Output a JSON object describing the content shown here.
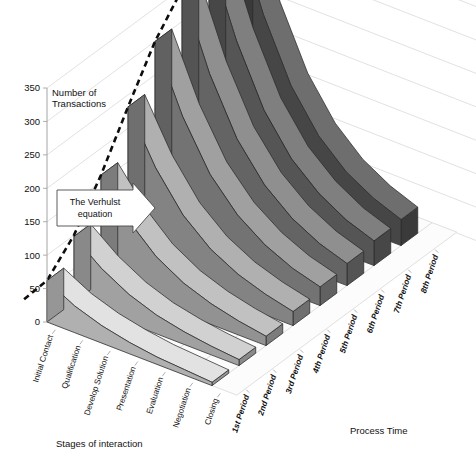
{
  "chart_data": {
    "type": "area",
    "title": "",
    "subtitle": "",
    "zlabel": "Number of Transactions",
    "xlabel": "Stages of interaction",
    "ylabel": "Process Time",
    "zlim": [
      0,
      350
    ],
    "zticks": [
      "0",
      "50",
      "100",
      "150",
      "200",
      "250",
      "300",
      "350"
    ],
    "ztick_values": [
      0,
      50,
      100,
      150,
      200,
      250,
      300,
      350
    ],
    "grid": true,
    "legend": "none",
    "categories": [
      "Initial Contact",
      "Qualification",
      "Develop Solution",
      "Presentation",
      "Evaluation",
      "Negotiation",
      "Closing"
    ],
    "depth_categories": [
      "1st Period",
      "2nd Period",
      "3rd Period",
      "4th Period",
      "5th Period",
      "6th Period",
      "7th Period",
      "8th Period"
    ],
    "annotations": [
      {
        "text_line1": "The Verhulst",
        "text_line2": "equation",
        "shape": "right-arrow-callout"
      }
    ],
    "series": [
      {
        "name": "1st Period",
        "values": [
          62,
          40,
          26,
          17,
          11,
          8,
          5
        ]
      },
      {
        "name": "2nd Period",
        "values": [
          98,
          66,
          43,
          28,
          19,
          13,
          9
        ]
      },
      {
        "name": "3rd Period",
        "values": [
          160,
          108,
          70,
          46,
          31,
          21,
          14
        ]
      },
      {
        "name": "4th Period",
        "values": [
          232,
          157,
          102,
          67,
          45,
          31,
          21
        ]
      },
      {
        "name": "5th Period",
        "values": [
          300,
          204,
          133,
          88,
          59,
          40,
          28
        ]
      },
      {
        "name": "6th Period",
        "values": [
          348,
          238,
          156,
          103,
          69,
          47,
          33
        ]
      },
      {
        "name": "7th Period",
        "values": [
          372,
          257,
          169,
          112,
          76,
          52,
          37
        ]
      },
      {
        "name": "8th Period",
        "values": [
          382,
          266,
          176,
          117,
          79,
          55,
          39
        ]
      }
    ],
    "curve_name": "The Verhulst equation",
    "curve_values": [
      40,
      62,
      100,
      160,
      232,
      300,
      348,
      382
    ]
  },
  "axes": {
    "z_title": "Number of Transactions",
    "x_title": "Stages of interaction",
    "y_title": "Process Time"
  },
  "callout": {
    "line1": "The Verhulst",
    "line2": "equation"
  },
  "colors": {
    "background": "#ffffff",
    "gridline": "#d9d9d9",
    "axis": "#9a9a9a",
    "curve": "#0d0d0d",
    "ribbon_front": "#e2e2e2",
    "ribbon_back": "#6e6e6e",
    "edge": "#2b2b2b"
  }
}
